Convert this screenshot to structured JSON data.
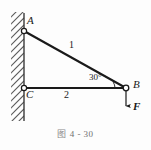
{
  "figure": {
    "caption_marker": "图",
    "caption_text": "4 - 30",
    "caption_full": "图 4 - 30",
    "background_color": "#fdfdfd",
    "line_color": "#1a1a1a",
    "hatch_color": "#555555"
  },
  "nodes": [
    {
      "id": "A",
      "label": "A",
      "x": 24,
      "y": 31,
      "type": "pin-joint-on-wall"
    },
    {
      "id": "C",
      "label": "C",
      "x": 24,
      "y": 88,
      "type": "pin-joint-on-wall"
    },
    {
      "id": "B",
      "label": "B",
      "x": 126,
      "y": 88,
      "type": "pin-joint-free"
    }
  ],
  "members": [
    {
      "id": "AB",
      "label": "1",
      "from": "A",
      "to": "B"
    },
    {
      "id": "CB",
      "label": "2",
      "from": "C",
      "to": "B"
    }
  ],
  "angle": {
    "value": "30",
    "unit": "°",
    "label": "30°",
    "at_node": "B"
  },
  "load": {
    "label": "F",
    "direction": "down",
    "applied_at": "B"
  },
  "support": {
    "type": "fixed-wall",
    "orientation": "vertical",
    "side": "left"
  }
}
